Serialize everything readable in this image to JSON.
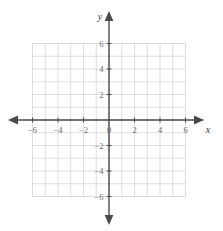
{
  "figure": {
    "kind": "cartesian-coordinate-plane",
    "background_color": "#ffffff",
    "grid_color": "#d6d6d6",
    "axis_color": "#4a4a4a",
    "label_color": "#6b6b6b",
    "axis_name_color": "#3d3d3d"
  },
  "axes": {
    "x_name": "x",
    "y_name": "y",
    "origin_label": "0"
  },
  "chart_data": {
    "type": "scatter",
    "title": "",
    "xlabel": "x",
    "ylabel": "y",
    "xlim": [
      -6,
      6
    ],
    "ylim": [
      -6,
      6
    ],
    "grid": true,
    "grid_step": 1,
    "legend": null,
    "series": [],
    "x_tick_values": [
      -6,
      -4,
      -2,
      0,
      2,
      4,
      6
    ],
    "y_tick_values": [
      6,
      4,
      2,
      -2,
      -4,
      -6
    ],
    "x_tick_labels": [
      "−6",
      "−4",
      "−2",
      "0",
      "2",
      "4",
      "6"
    ],
    "y_tick_labels": [
      "6",
      "4",
      "2",
      "−2",
      "−4",
      "−6"
    ],
    "annotations": []
  }
}
